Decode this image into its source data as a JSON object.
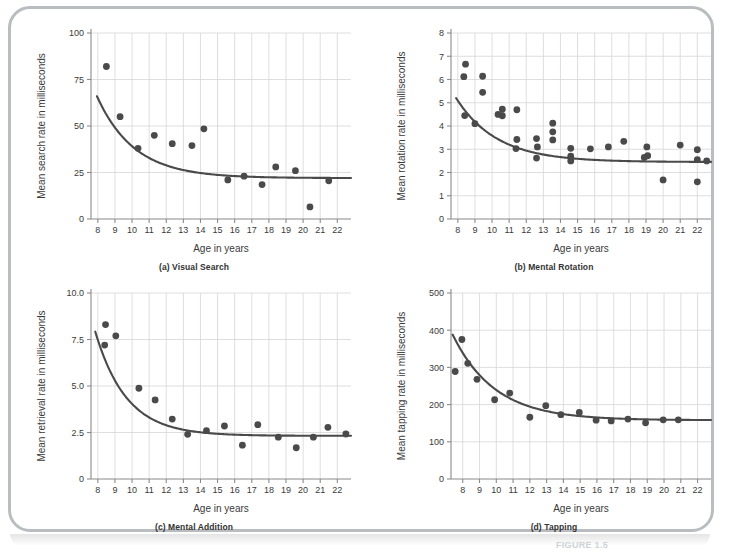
{
  "figure": {
    "label": "FIGURE 1.5",
    "frame_color": "#b9bdc0",
    "background": "#ffffff",
    "marker_color": "#4a4a4a",
    "curve_color": "#4a4a4a",
    "grid_color": "#d6d6d6",
    "axis_color": "#8a8a8a",
    "text_color": "#3a3a3a"
  },
  "panels": [
    {
      "id": "a",
      "caption": "(a) Visual Search",
      "chart_data": {
        "type": "scatter",
        "title": "(a) Visual Search",
        "xlabel": "Age in years",
        "ylabel": "Mean search rate in milliseconds",
        "xlim": [
          7.6,
          22.8
        ],
        "ylim": [
          0,
          100
        ],
        "xticks": [
          8,
          9,
          10,
          11,
          12,
          13,
          14,
          15,
          16,
          17,
          18,
          19,
          20,
          21,
          22
        ],
        "yticks": [
          0,
          25,
          50,
          75,
          100
        ],
        "ytick_labels": [
          "0",
          "25",
          "50",
          "75",
          "100"
        ],
        "grid": true,
        "legend": "none",
        "points": [
          {
            "x": 8.5,
            "y": 82
          },
          {
            "x": 9.3,
            "y": 55
          },
          {
            "x": 10.35,
            "y": 38
          },
          {
            "x": 11.3,
            "y": 45
          },
          {
            "x": 12.35,
            "y": 40.5
          },
          {
            "x": 13.5,
            "y": 39.5
          },
          {
            "x": 14.2,
            "y": 48.5
          },
          {
            "x": 15.6,
            "y": 21
          },
          {
            "x": 16.55,
            "y": 23
          },
          {
            "x": 17.6,
            "y": 18.5
          },
          {
            "x": 18.4,
            "y": 28
          },
          {
            "x": 19.55,
            "y": 26
          },
          {
            "x": 20.4,
            "y": 6.5
          },
          {
            "x": 21.5,
            "y": 20.5
          }
        ],
        "curve": {
          "kind": "exponential_decay",
          "asymptote": 22,
          "amplitude": 44,
          "rate": 0.46,
          "x0": 7.95
        }
      }
    },
    {
      "id": "b",
      "caption": "(b) Mental Rotation",
      "chart_data": {
        "type": "scatter",
        "title": "(b) Mental Rotation",
        "xlabel": "Age in years",
        "ylabel": "Mean rotation rate in milliseconds",
        "xlim": [
          7.6,
          22.8
        ],
        "ylim": [
          0,
          8
        ],
        "xticks": [
          8,
          9,
          10,
          11,
          12,
          13,
          14,
          15,
          16,
          17,
          18,
          19,
          20,
          21,
          22
        ],
        "yticks": [
          0,
          1,
          2,
          3,
          4,
          5,
          6,
          7,
          8
        ],
        "ytick_labels": [
          "0",
          "1",
          "2",
          "3",
          "4",
          "5",
          "6",
          "7",
          "8"
        ],
        "grid": true,
        "legend": "none",
        "points": [
          {
            "x": 8.45,
            "y": 6.66
          },
          {
            "x": 8.35,
            "y": 6.12
          },
          {
            "x": 9.45,
            "y": 6.14
          },
          {
            "x": 9.45,
            "y": 5.45
          },
          {
            "x": 8.4,
            "y": 4.45
          },
          {
            "x": 9.0,
            "y": 4.1
          },
          {
            "x": 10.6,
            "y": 4.72
          },
          {
            "x": 10.35,
            "y": 4.5
          },
          {
            "x": 10.6,
            "y": 4.44
          },
          {
            "x": 11.45,
            "y": 4.7
          },
          {
            "x": 11.4,
            "y": 3.03
          },
          {
            "x": 11.45,
            "y": 3.42
          },
          {
            "x": 12.6,
            "y": 3.46
          },
          {
            "x": 12.65,
            "y": 3.1
          },
          {
            "x": 12.6,
            "y": 2.62
          },
          {
            "x": 13.55,
            "y": 4.12
          },
          {
            "x": 13.55,
            "y": 3.75
          },
          {
            "x": 13.55,
            "y": 3.4
          },
          {
            "x": 14.6,
            "y": 3.04
          },
          {
            "x": 14.6,
            "y": 2.7
          },
          {
            "x": 14.6,
            "y": 2.5
          },
          {
            "x": 15.75,
            "y": 3.02
          },
          {
            "x": 16.8,
            "y": 3.1
          },
          {
            "x": 17.7,
            "y": 3.34
          },
          {
            "x": 18.9,
            "y": 2.65
          },
          {
            "x": 19.05,
            "y": 3.1
          },
          {
            "x": 19.1,
            "y": 2.72
          },
          {
            "x": 20.0,
            "y": 1.68
          },
          {
            "x": 21.0,
            "y": 3.18
          },
          {
            "x": 22.0,
            "y": 2.98
          },
          {
            "x": 22.0,
            "y": 2.55
          },
          {
            "x": 22.0,
            "y": 1.6
          },
          {
            "x": 22.55,
            "y": 2.5
          }
        ],
        "curve": {
          "kind": "exponential_decay",
          "asymptote": 2.45,
          "amplitude": 2.75,
          "rate": 0.42,
          "x0": 7.9
        }
      }
    },
    {
      "id": "c",
      "caption": "(c) Mental Addition",
      "chart_data": {
        "type": "scatter",
        "title": "(c) Mental Addition",
        "xlabel": "Age in years",
        "ylabel": "Mean retrieval rate in milliseconds",
        "xlim": [
          7.6,
          22.8
        ],
        "ylim": [
          0,
          10
        ],
        "xticks": [
          8,
          9,
          10,
          11,
          12,
          13,
          14,
          15,
          16,
          17,
          18,
          19,
          20,
          21,
          22
        ],
        "yticks": [
          0,
          2.5,
          5.0,
          7.5,
          10.0
        ],
        "ytick_labels": [
          "0",
          "2.5",
          "5.0",
          "7.5",
          "10.0"
        ],
        "grid": true,
        "legend": "none",
        "points": [
          {
            "x": 8.45,
            "y": 8.3
          },
          {
            "x": 8.4,
            "y": 7.2
          },
          {
            "x": 9.05,
            "y": 7.7
          },
          {
            "x": 10.4,
            "y": 4.88
          },
          {
            "x": 11.35,
            "y": 4.25
          },
          {
            "x": 12.35,
            "y": 3.22
          },
          {
            "x": 13.25,
            "y": 2.4
          },
          {
            "x": 14.35,
            "y": 2.6
          },
          {
            "x": 15.4,
            "y": 2.85
          },
          {
            "x": 16.45,
            "y": 1.82
          },
          {
            "x": 17.35,
            "y": 2.92
          },
          {
            "x": 18.55,
            "y": 2.25
          },
          {
            "x": 19.6,
            "y": 1.68
          },
          {
            "x": 20.6,
            "y": 2.25
          },
          {
            "x": 21.45,
            "y": 2.78
          },
          {
            "x": 22.5,
            "y": 2.42
          }
        ],
        "curve": {
          "kind": "exponential_decay",
          "asymptote": 2.32,
          "amplitude": 5.6,
          "rate": 0.55,
          "x0": 7.85
        }
      }
    },
    {
      "id": "d",
      "caption": "(d) Tapping",
      "chart_data": {
        "type": "scatter",
        "title": "(d) Tapping",
        "xlabel": "Age in years",
        "ylabel": "Mean tapping rate in milliseconds",
        "xlim": [
          7.3,
          22.8
        ],
        "ylim": [
          0,
          500
        ],
        "xticks": [
          8,
          9,
          10,
          11,
          12,
          13,
          14,
          15,
          16,
          17,
          18,
          19,
          20,
          21,
          22
        ],
        "yticks": [
          0,
          100,
          200,
          300,
          400,
          500
        ],
        "ytick_labels": [
          "0",
          "100",
          "200",
          "300",
          "400",
          "500"
        ],
        "grid": true,
        "legend": "none",
        "points": [
          {
            "x": 7.55,
            "y": 289
          },
          {
            "x": 7.95,
            "y": 375
          },
          {
            "x": 8.3,
            "y": 311
          },
          {
            "x": 8.85,
            "y": 268
          },
          {
            "x": 9.9,
            "y": 213
          },
          {
            "x": 10.8,
            "y": 231
          },
          {
            "x": 12.0,
            "y": 166
          },
          {
            "x": 12.95,
            "y": 197
          },
          {
            "x": 13.85,
            "y": 173
          },
          {
            "x": 14.95,
            "y": 179
          },
          {
            "x": 15.95,
            "y": 158
          },
          {
            "x": 16.85,
            "y": 156
          },
          {
            "x": 17.85,
            "y": 161
          },
          {
            "x": 18.9,
            "y": 151
          },
          {
            "x": 19.95,
            "y": 159
          },
          {
            "x": 20.85,
            "y": 159
          }
        ],
        "curve": {
          "kind": "exponential_decay",
          "asymptote": 158,
          "amplitude": 230,
          "rate": 0.4,
          "x0": 7.4
        }
      }
    }
  ]
}
